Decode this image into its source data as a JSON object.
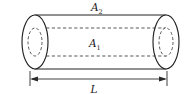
{
  "figure": {
    "kind": "hollow-cylinder-cross-section",
    "background_color": "#ffffff",
    "stroke_color": "#222222",
    "hidden_line_color": "#3a3a3a",
    "dimension_color": "#2b2b2b"
  },
  "labels": {
    "outer_area": {
      "base": "A",
      "subscript": "2",
      "role": "outer cross-sectional area",
      "position": "above cylinder, centered"
    },
    "inner_area": {
      "base": "A",
      "subscript": "1",
      "role": "inner bore cross-sectional area",
      "position": "inside cylinder, centered"
    },
    "length": {
      "base": "L",
      "subscript": "",
      "role": "cylinder length",
      "position": "below dimension arrow, centered"
    }
  },
  "geometry": {
    "left_cap_center_x": 35,
    "right_cap_center_x": 166,
    "cap_center_y": 42,
    "cap_radius_x": 13,
    "cap_radius_y": 27,
    "bore_radius_x": 7,
    "bore_radius_y": 14,
    "body_top_y": 15,
    "body_bottom_y": 69
  },
  "dimension": {
    "line_y": 79,
    "left_x": 30,
    "right_x": 167,
    "arrow_style": "double-headed",
    "extension_ticks": true
  }
}
